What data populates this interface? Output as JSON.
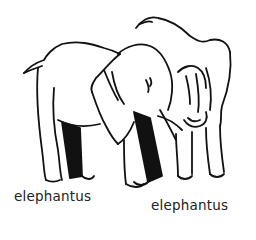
{
  "illustration": {
    "subject": "two elephants line drawing",
    "labels": [
      {
        "text": "elephantus"
      },
      {
        "text": "elephantus"
      }
    ],
    "colors": {
      "ink": "#111111",
      "background": "#ffffff",
      "label": "#222222"
    }
  }
}
